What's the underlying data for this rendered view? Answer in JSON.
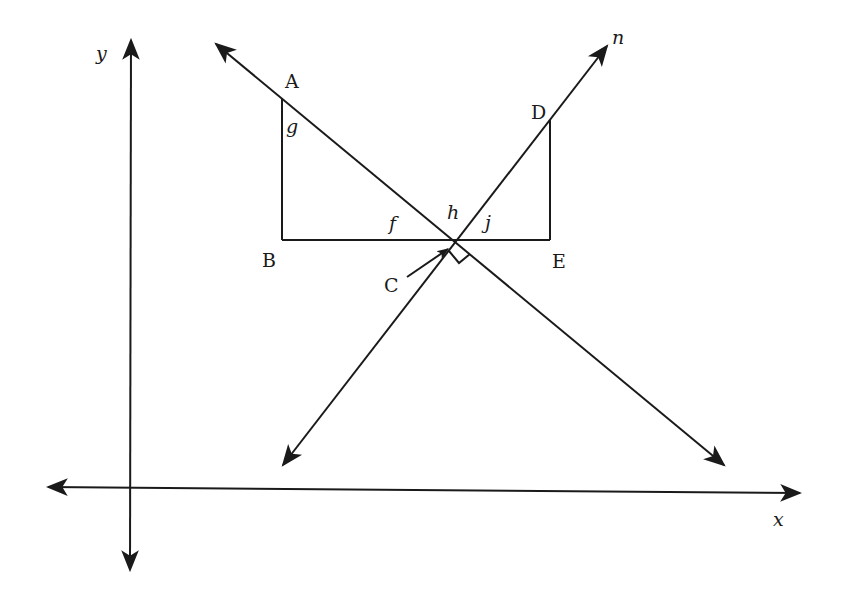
{
  "diagram": {
    "type": "coordinate-geometry",
    "axes": {
      "x_label": "x",
      "y_label": "y"
    },
    "lines": [
      {
        "name": "line-through-A",
        "label": ""
      },
      {
        "name": "line-n",
        "label": "n"
      }
    ],
    "points": {
      "A": "A",
      "B": "B",
      "C": "C",
      "D": "D",
      "E": "E"
    },
    "angles": {
      "g": "g",
      "f": "f",
      "h": "h",
      "j": "j"
    },
    "annotations": {
      "right_angle_at": "C"
    },
    "colors": {
      "stroke": "#1a1a1a",
      "background": "#ffffff"
    }
  }
}
